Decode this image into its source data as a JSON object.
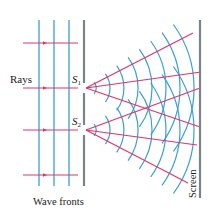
{
  "figure": {
    "labels": {
      "rays": "Rays",
      "s1_letter": "S",
      "s1_sub": "1",
      "s2_letter": "S",
      "s2_sub": "2",
      "wave_fronts": "Wave fronts",
      "screen": "Screen"
    },
    "colors": {
      "wave": "#3a9fd6",
      "ray": "#e0356a",
      "barrier": "#7d8288",
      "text": "#222222"
    },
    "incoming_wavefronts_x": [
      39,
      54,
      69
    ],
    "incoming_wavefronts_y": [
      20,
      186
    ],
    "incoming_rays_y": [
      43,
      88,
      130,
      175
    ],
    "incoming_rays_x": [
      23,
      78
    ],
    "barrier": {
      "x": 84,
      "y_top": 20,
      "y_bottom": 186,
      "slit_gap": 5
    },
    "slits": [
      {
        "name": "S1",
        "x": 86,
        "y": 88
      },
      {
        "name": "S2",
        "x": 86,
        "y": 130
      }
    ],
    "arc_radii": [
      10,
      24,
      38,
      52,
      66,
      80,
      94,
      108
    ],
    "arc_half_angle_deg": 36,
    "diffracted_rays": [
      {
        "from": "S1",
        "to": [
          193,
          33
        ]
      },
      {
        "from": "S1",
        "to": [
          201,
          72
        ]
      },
      {
        "from": "S1",
        "to": [
          200,
          127
        ]
      },
      {
        "from": "S2",
        "to": [
          200,
          88
        ]
      },
      {
        "from": "S2",
        "to": [
          197,
          145
        ]
      },
      {
        "from": "S2",
        "to": [
          188,
          183
        ]
      }
    ],
    "screen": {
      "x": 200,
      "y_top": 20,
      "y_bottom": 198
    }
  }
}
